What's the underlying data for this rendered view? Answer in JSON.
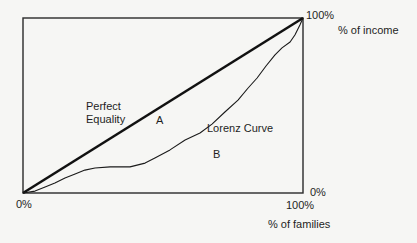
{
  "chart_data": {
    "type": "line",
    "title": "",
    "xlabel": "% of families",
    "ylabel": "% of income",
    "xlim": [
      0,
      100
    ],
    "ylim": [
      0,
      100
    ],
    "grid": false,
    "x_tick_labels": [
      "0%",
      "100%"
    ],
    "y_tick_labels": [
      "0%",
      "100%"
    ],
    "series": [
      {
        "name": "Perfect Equality",
        "style": "thick",
        "x": [
          0,
          100
        ],
        "y": [
          0,
          100
        ]
      },
      {
        "name": "Lorenz Curve",
        "style": "thin",
        "x": [
          0,
          4.3,
          7.9,
          11.4,
          15.0,
          18.6,
          22.1,
          25.7,
          31.1,
          38.2,
          43.6,
          47.1,
          52.5,
          57.9,
          63.2,
          67.5,
          72.1,
          76.8,
          80.4,
          83.6,
          86.8,
          90.0,
          92.5,
          95.4,
          97.1,
          98.9,
          100
        ],
        "y": [
          0,
          1.1,
          3.4,
          5.7,
          8.6,
          10.9,
          13.1,
          14.3,
          14.9,
          14.9,
          17.1,
          20.0,
          24.6,
          30.3,
          34.3,
          39.4,
          46.3,
          53.1,
          60.0,
          65.7,
          72.6,
          78.9,
          82.9,
          86.3,
          90.3,
          96.0,
          100
        ]
      }
    ],
    "annotations": [
      {
        "text": "Perfect Equality",
        "region": "label for diagonal line"
      },
      {
        "text": "A",
        "region": "area between equality line and Lorenz curve"
      },
      {
        "text": "Lorenz Curve",
        "region": "label for curve"
      },
      {
        "text": "B",
        "region": "area under Lorenz curve"
      }
    ]
  },
  "labels": {
    "y_top": "100%",
    "y_axis_title": "% of income",
    "y_bottom": "0%",
    "x_left": "0%",
    "x_right": "100%",
    "x_axis_title": "% of families",
    "perfect_equality": "Perfect\nEquality",
    "area_a": "A",
    "lorenz_curve": "Lorenz Curve",
    "area_b": "B"
  },
  "colors": {
    "background": "#f6f6f4",
    "lines": "#1a1a1a",
    "frame": "#2a2a2a"
  }
}
